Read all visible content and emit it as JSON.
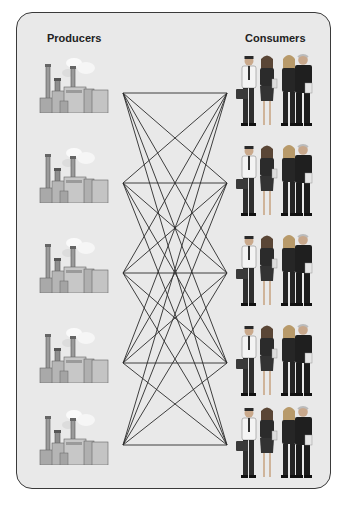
{
  "diagram": {
    "type": "complete-bipartite-network",
    "left_column": {
      "title": "Producers",
      "node_icon": "factory-icon",
      "count": 5
    },
    "right_column": {
      "title": "Consumers",
      "node_icon": "people-group-icon",
      "count": 5
    },
    "nodes_left": [
      {
        "id": "P1",
        "x": 123,
        "y": 93
      },
      {
        "id": "P2",
        "x": 123,
        "y": 183
      },
      {
        "id": "P3",
        "x": 123,
        "y": 273
      },
      {
        "id": "P4",
        "x": 123,
        "y": 363
      },
      {
        "id": "P5",
        "x": 123,
        "y": 445
      }
    ],
    "nodes_right": [
      {
        "id": "C1",
        "x": 227,
        "y": 93
      },
      {
        "id": "C2",
        "x": 227,
        "y": 183
      },
      {
        "id": "C3",
        "x": 227,
        "y": 273
      },
      {
        "id": "C4",
        "x": 227,
        "y": 363
      },
      {
        "id": "C5",
        "x": 227,
        "y": 445
      }
    ],
    "edges": "every producer connected to every consumer (25 edges)",
    "colors": {
      "background": "#e9e9e9",
      "border": "#3a3a3a",
      "line": "#2a2a2a"
    }
  }
}
